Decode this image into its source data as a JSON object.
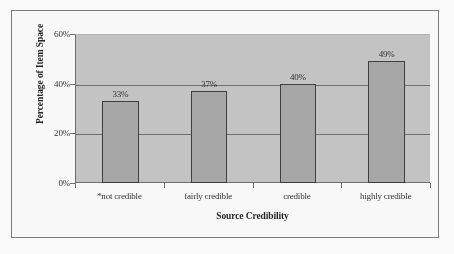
{
  "chart_data": {
    "type": "bar",
    "title": "",
    "xlabel": "Source Credibility",
    "ylabel": "Percentage of Item Space",
    "categories": [
      "*not credible",
      "fairly credible",
      "credible",
      "highly credible"
    ],
    "values": [
      33,
      37,
      40,
      49
    ],
    "value_labels": [
      "33%",
      "37%",
      "40%",
      "49%"
    ],
    "ylim": [
      0,
      60
    ],
    "ytick_values": [
      0,
      20,
      40,
      60
    ],
    "ytick_labels": [
      "0%",
      "20%",
      "40%",
      "60%"
    ],
    "grid": true,
    "legend": "none",
    "bar_fill_color": "#a9a9ac",
    "bar_border_color": "#3b3b40",
    "plot_background_color": "#c6c6c8",
    "axis_color": "#6e6e73",
    "frame_color": "#7d7d82"
  }
}
